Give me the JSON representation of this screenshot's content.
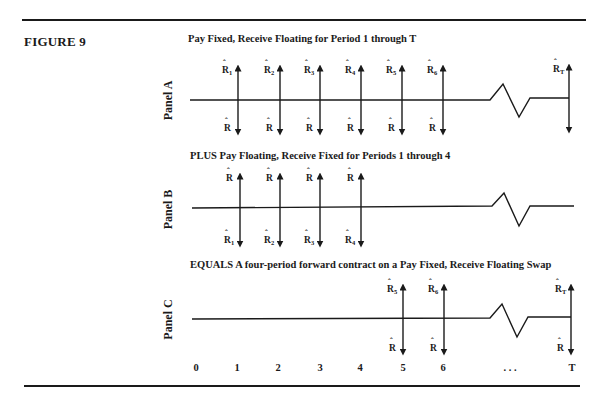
{
  "figure": {
    "label": "FIGURE 9"
  },
  "panels": [
    {
      "id": "A",
      "label": "Panel A",
      "title": "Pay Fixed, Receive Floating for Period 1 through T",
      "arrows": [
        {
          "x": 238,
          "up": {
            "base": "R",
            "sub": "1"
          },
          "down": {
            "base": "R",
            "sub": ""
          }
        },
        {
          "x": 280,
          "up": {
            "base": "R",
            "sub": "2"
          },
          "down": {
            "base": "R",
            "sub": ""
          }
        },
        {
          "x": 320,
          "up": {
            "base": "R",
            "sub": "3"
          },
          "down": {
            "base": "R",
            "sub": ""
          }
        },
        {
          "x": 361,
          "up": {
            "base": "R",
            "sub": "4"
          },
          "down": {
            "base": "R",
            "sub": ""
          }
        },
        {
          "x": 402,
          "up": {
            "base": "R",
            "sub": "5"
          },
          "down": {
            "base": "R",
            "sub": ""
          }
        },
        {
          "x": 443,
          "up": {
            "base": "R",
            "sub": "6"
          },
          "down": {
            "base": "R",
            "sub": ""
          }
        },
        {
          "x": 569,
          "up": {
            "base": "R",
            "sub": "T"
          },
          "down": {
            "base": "",
            "sub": ""
          }
        }
      ]
    },
    {
      "id": "B",
      "label": "Panel B",
      "title": "PLUS Pay Floating, Receive Fixed for Periods 1 through 4",
      "arrows": [
        {
          "x": 240,
          "up": {
            "base": "R",
            "sub": ""
          },
          "down": {
            "base": "R",
            "sub": "1"
          }
        },
        {
          "x": 280,
          "up": {
            "base": "R",
            "sub": ""
          },
          "down": {
            "base": "R",
            "sub": "2"
          }
        },
        {
          "x": 320,
          "up": {
            "base": "R",
            "sub": ""
          },
          "down": {
            "base": "R",
            "sub": "3"
          }
        },
        {
          "x": 361,
          "up": {
            "base": "R",
            "sub": ""
          },
          "down": {
            "base": "R",
            "sub": "4"
          }
        }
      ]
    },
    {
      "id": "C",
      "label": "Panel C",
      "title": "EQUALS A four-period forward contract on a Pay Fixed, Receive Floating Swap",
      "arrows": [
        {
          "x": 403,
          "up": {
            "base": "R",
            "sub": "5"
          },
          "down": {
            "base": "R",
            "sub": ""
          }
        },
        {
          "x": 444,
          "up": {
            "base": "R",
            "sub": "6"
          },
          "down": {
            "base": "R",
            "sub": ""
          }
        },
        {
          "x": 571,
          "up": {
            "base": "R",
            "sub": "T"
          },
          "down": {
            "base": "R",
            "sub": ""
          }
        }
      ]
    }
  ],
  "axis": {
    "ticks": [
      {
        "label": "0",
        "x": 196
      },
      {
        "label": "1",
        "x": 237
      },
      {
        "label": "2",
        "x": 278
      },
      {
        "label": "3",
        "x": 320
      },
      {
        "label": "4",
        "x": 360
      },
      {
        "label": "5",
        "x": 403
      },
      {
        "label": "6",
        "x": 443
      },
      {
        "label": ". . .",
        "x": 510
      },
      {
        "label": "T",
        "x": 572
      }
    ]
  }
}
